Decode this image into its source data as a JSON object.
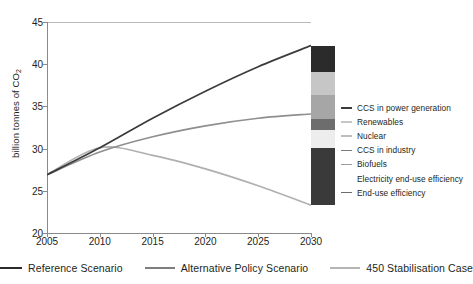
{
  "chart_data": {
    "type": "line",
    "title": "",
    "xlabel": "",
    "ylabel": "billion tonnes of CO2",
    "ylabel_prefix": "billion tonnes of CO",
    "ylabel_sub": "2",
    "xlim": [
      2005,
      2030
    ],
    "ylim": [
      20,
      45
    ],
    "yticks": [
      20,
      25,
      30,
      35,
      40,
      45
    ],
    "xticks": [
      2005,
      2010,
      2015,
      2020,
      2025,
      2030
    ],
    "grid": false,
    "legend_position": "bottom",
    "x": [
      2005,
      2010,
      2015,
      2020,
      2025,
      2030
    ],
    "series": [
      {
        "name": "Reference Scenario",
        "color": "#3b3b3b",
        "values": [
          26.9,
          30.1,
          33.6,
          36.8,
          39.7,
          42.2
        ]
      },
      {
        "name": "Alternative Policy Scenario",
        "color": "#8f8f8f",
        "values": [
          26.9,
          29.6,
          31.4,
          32.7,
          33.6,
          34.1
        ]
      },
      {
        "name": "450 Stabilisation Case",
        "color": "#b0b0b0",
        "values": [
          26.9,
          30.1,
          29.2,
          27.6,
          25.6,
          23.3
        ]
      }
    ],
    "wedge_bar": {
      "x": 2030,
      "bottom": 23.3,
      "top": 42.2,
      "segments": [
        {
          "name": "CCS in power generation",
          "color": "#2b2b2b",
          "span": 3.4
        },
        {
          "name": "Renewables",
          "color": "#c6c6c6",
          "span": 3.1
        },
        {
          "name": "Nuclear",
          "color": "#a6a6a6",
          "span": 3.1
        },
        {
          "name": "CCS in industry",
          "color": "#6d6d6d",
          "span": 1.4
        },
        {
          "name": "Biofuels",
          "color": "#ededed",
          "span": 2.4
        },
        {
          "name": "Electricity end-use efficiency",
          "color": "#3a3a3a",
          "span": 3.3
        },
        {
          "name": "End-use efficiency",
          "color": "#3a3a3a",
          "span": 4.2
        }
      ]
    }
  },
  "right_legend": {
    "items": [
      {
        "label": "CCS in power generation",
        "dash_color": "#3b3b3b",
        "has_dash": true
      },
      {
        "label": "Renewables",
        "dash_color": "#c6c6c6",
        "has_dash": true
      },
      {
        "label": "Nuclear",
        "dash_color": "#bdbdbd",
        "has_dash": true
      },
      {
        "label": "CCS in industry",
        "dash_color": "#7a7a7a",
        "has_dash": true
      },
      {
        "label": "Biofuels",
        "dash_color": "#9a9a9a",
        "has_dash": true
      },
      {
        "label": "Electricity end-use efficiency",
        "dash_color": "#ffffff",
        "has_dash": false
      },
      {
        "label": "End-use efficiency",
        "dash_color": "#6d6d6d",
        "has_dash": true
      }
    ]
  },
  "bottom_legend": {
    "items": [
      {
        "label": "Reference Scenario",
        "color": "#2b2b2b"
      },
      {
        "label": "Alternative Policy Scenario",
        "color": "#7e7e7e"
      },
      {
        "label": "450 Stabilisation Case",
        "color": "#b4b4b4"
      }
    ]
  }
}
